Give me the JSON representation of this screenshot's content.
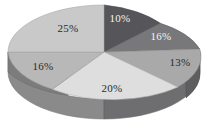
{
  "chart_data": {
    "type": "pie",
    "title": "",
    "subtitle": "",
    "xlabel": "",
    "ylabel": "",
    "legend": "none",
    "grid": false,
    "three_d": true,
    "background": "#ffffff",
    "categories": [
      "10%",
      "16%",
      "13%",
      "20%",
      "16%",
      "25%"
    ],
    "values": [
      10,
      16,
      13,
      20,
      16,
      25
    ],
    "total": 100,
    "units": "percent",
    "slices": [
      {
        "id": "slice-1",
        "label": "10%",
        "value": 10,
        "position": "top",
        "fill": "#56565a",
        "side_fill": "#3e3e42",
        "label_color": "light",
        "start_angle": 0,
        "end_angle": 36,
        "label_x": 120,
        "label_y": 22
      },
      {
        "id": "slice-2",
        "label": "16%",
        "value": 16,
        "position": "upper-right",
        "fill": "#78787b",
        "side_fill": "#5a5a5d",
        "label_color": "light",
        "start_angle": 36,
        "end_angle": 93.6,
        "label_x": 161,
        "label_y": 40
      },
      {
        "id": "slice-3",
        "label": "13%",
        "value": 13,
        "position": "right",
        "fill": "#a9a9a9",
        "side_fill": "#7f7f7f",
        "label_color": "dark",
        "start_angle": 93.6,
        "end_angle": 140.4,
        "label_x": 180,
        "label_y": 66
      },
      {
        "id": "slice-4",
        "label": "20%",
        "value": 20,
        "position": "bottom",
        "fill": "#dedede",
        "side_fill": "#a6a6a6",
        "label_color": "dark",
        "start_angle": 140.4,
        "end_angle": 212.4,
        "label_x": 112,
        "label_y": 92
      },
      {
        "id": "slice-5",
        "label": "16%",
        "value": 16,
        "position": "left",
        "fill": "#b8b8b8",
        "side_fill": "#8a8a8a",
        "label_color": "dark",
        "start_angle": 212.4,
        "end_angle": 270,
        "label_x": 43,
        "label_y": 70
      },
      {
        "id": "slice-6",
        "label": "25%",
        "value": 25,
        "position": "upper-left",
        "fill": "#c9c9c9",
        "side_fill": "#989898",
        "label_color": "dark",
        "start_angle": 270,
        "end_angle": 360,
        "label_x": 68,
        "label_y": 32
      }
    ]
  }
}
